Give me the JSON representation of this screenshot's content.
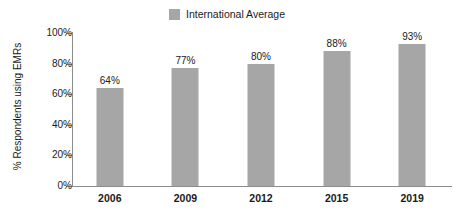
{
  "chart_data": {
    "type": "bar",
    "title": "",
    "xlabel": "",
    "ylabel": "% Respondents using EMRs",
    "categories": [
      "2006",
      "2009",
      "2012",
      "2015",
      "2019"
    ],
    "series": [
      {
        "name": "International Average",
        "values": [
          64,
          77,
          80,
          88,
          93
        ],
        "value_labels": [
          "64%",
          "77%",
          "80%",
          "88%",
          "93%"
        ],
        "color": "#a6a6a6"
      }
    ],
    "ylim": [
      0,
      100
    ],
    "yticks": [
      0,
      20,
      40,
      60,
      80,
      100
    ],
    "ytick_labels": [
      "0%",
      "20%",
      "40%",
      "60%",
      "80%",
      "100%"
    ],
    "grid": false,
    "legend_position": "top-center"
  },
  "legend": {
    "entries": [
      {
        "label": "International Average",
        "color": "#a6a6a6"
      }
    ]
  },
  "axes": {
    "y_title": "% Respondents using EMRs",
    "y_tick_labels": [
      "100%",
      "80%",
      "60%",
      "40%",
      "20%",
      "0%"
    ],
    "x_tick_labels": [
      "2006",
      "2009",
      "2012",
      "2015",
      "2019"
    ],
    "axis_color": "#8c8c8c"
  },
  "bars": [
    {
      "category": "2006",
      "value": 64,
      "label": "64%"
    },
    {
      "category": "2009",
      "value": 77,
      "label": "77%"
    },
    {
      "category": "2012",
      "value": 80,
      "label": "80%"
    },
    {
      "category": "2015",
      "value": 88,
      "label": "88%"
    },
    {
      "category": "2019",
      "value": 93,
      "label": "93%"
    }
  ]
}
